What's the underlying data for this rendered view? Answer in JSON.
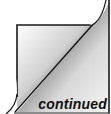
{
  "graphic": {
    "icon": "page-curl-icon",
    "label": "continued",
    "colors": {
      "frame": "#1a1a1a",
      "light": "#ffffff",
      "dark": "#111111",
      "mid": "#8a8a8a"
    }
  }
}
